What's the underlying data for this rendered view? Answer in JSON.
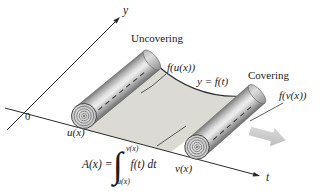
{
  "figure": {
    "axis_y_label": "y",
    "axis_t_label": "t",
    "origin_label": "0",
    "uncovering_label": "Uncovering",
    "covering_label": "Covering",
    "f_u_label": "f(u(x))",
    "f_v_label": "f(v(x))",
    "curve_label": "y = f(t)",
    "u_label": "u(x)",
    "v_label": "v(x)",
    "formula": {
      "lhs": "A(x) =",
      "integral_sign": "∫",
      "upper_limit": "v(x)",
      "lower_limit": "u(x)",
      "integrand": "f(t) dt"
    },
    "colors": {
      "background": "#ffffff",
      "region_fill": "#dcdad4",
      "roll_dark": "#6d6d6d",
      "roll_light": "#ececec",
      "line": "#2a2a2a",
      "motion_arrow_fill": "#d2d2d2"
    }
  }
}
